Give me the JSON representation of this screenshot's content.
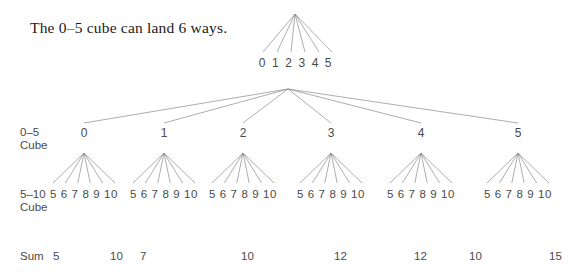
{
  "caption": "The 0–5 cube can land 6 ways.",
  "row_labels": {
    "top_cube": "0–5\nCube",
    "top_cube_line1": "0–5",
    "top_cube_line2": "Cube",
    "bottom_cube_line1": "5–10",
    "bottom_cube_line2": "Cube",
    "sum": "Sum"
  },
  "top_tree": {
    "apex": {
      "x": 295,
      "y": 14
    },
    "leaf_labels": [
      "0",
      "1",
      "2",
      "3",
      "4",
      "5"
    ],
    "leaf_text": "0 1 2 3 4 5",
    "leaf_center_x": 296,
    "leaf_y": 62,
    "leaf_xs": [
      263,
      277,
      291,
      305,
      319,
      332
    ]
  },
  "main_tree": {
    "apex": {
      "x": 288,
      "y": 89
    },
    "nodes": [
      {
        "label": "0",
        "x": 84
      },
      {
        "label": "1",
        "x": 164
      },
      {
        "label": "2",
        "x": 243
      },
      {
        "label": "3",
        "x": 331
      },
      {
        "label": "4",
        "x": 421
      },
      {
        "label": "5",
        "x": 518
      }
    ],
    "node_label_y": 126,
    "subtree_apex_y": 153,
    "subtree_leaf_y": 188,
    "subtree_leaf_labels": [
      "5",
      "6",
      "7",
      "8",
      "9",
      "10"
    ],
    "subtree_leaf_text": "5 6 7 8 9 10",
    "subtree_half_width": 31
  },
  "sums": [
    {
      "value": "5",
      "x": 53
    },
    {
      "value": "10",
      "x": 110
    },
    {
      "value": "7",
      "x": 140
    },
    {
      "value": "10",
      "x": 241
    },
    {
      "value": "12",
      "x": 334
    },
    {
      "value": "12",
      "x": 414
    },
    {
      "value": "10",
      "x": 469
    },
    {
      "value": "15",
      "x": 549
    }
  ],
  "style": {
    "line_color": "#8a8a8a",
    "text_color": "#4a4a4a",
    "caption_color": "#1b1b1b",
    "background": "#ffffff"
  }
}
